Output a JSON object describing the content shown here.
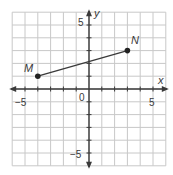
{
  "chart_data": {
    "type": "scatter",
    "title": "",
    "xlabel": "x",
    "ylabel": "y",
    "xlim": [
      -6,
      6
    ],
    "ylim": [
      -6,
      6
    ],
    "grid": true,
    "tick_labels": {
      "x": [
        {
          "value": -5,
          "label": "−5"
        },
        {
          "value": 0,
          "label": "0"
        },
        {
          "value": 5,
          "label": "5"
        }
      ],
      "y": [
        {
          "value": 5,
          "label": "5"
        },
        {
          "value": -5,
          "label": "−5"
        }
      ]
    },
    "points": [
      {
        "label": "M",
        "x": -4,
        "y": 1
      },
      {
        "label": "N",
        "x": 3,
        "y": 3
      }
    ],
    "segments": [
      {
        "from": "M",
        "to": "N"
      }
    ]
  },
  "labels": {
    "x_axis": "x",
    "y_axis": "y",
    "origin": "0",
    "x_neg5": "−5",
    "x_pos5": "5",
    "y_pos5": "5",
    "y_neg5": "−5",
    "point_m": "M",
    "point_n": "N"
  },
  "colors": {
    "grid": "#c8c8c8",
    "axis": "#3a3a3a",
    "segment": "#3a3a3a",
    "point": "#222222"
  }
}
